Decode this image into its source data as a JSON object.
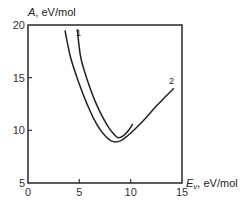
{
  "chart_data": {
    "type": "line",
    "title": "",
    "xlabel": "E_v, eV/mol",
    "xlabel_var": "E",
    "xlabel_sub": "v",
    "xlabel_unit": ", eV/mol",
    "ylabel": "A, eV/mol",
    "ylabel_var": "A",
    "ylabel_unit": ", eV/mol",
    "xlim": [
      0,
      15
    ],
    "ylim": [
      5,
      20
    ],
    "xticks": [
      0,
      5,
      10,
      15
    ],
    "yticks": [
      5,
      10,
      15,
      20
    ],
    "grid": false,
    "legend": "inline curve labels",
    "series": [
      {
        "name": "1",
        "x": [
          4.8,
          5.1,
          5.6,
          6.2,
          6.7,
          7.3,
          7.9,
          8.4,
          8.8,
          9.3,
          9.8,
          10.2
        ],
        "y": [
          19.6,
          17.1,
          15.3,
          13.6,
          12.4,
          11.2,
          10.2,
          9.6,
          9.3,
          9.5,
          10.0,
          10.6
        ]
      },
      {
        "name": "2",
        "x": [
          3.6,
          4.1,
          4.7,
          5.3,
          5.8,
          6.4,
          7.0,
          7.6,
          8.1,
          8.5,
          9.0,
          9.6,
          10.5,
          11.5,
          12.5,
          13.4,
          14.2
        ],
        "y": [
          19.5,
          17.1,
          15.2,
          13.6,
          12.4,
          11.1,
          10.1,
          9.4,
          9.0,
          8.9,
          9.0,
          9.4,
          10.2,
          11.2,
          12.3,
          13.2,
          14.0
        ]
      }
    ]
  },
  "labels": {
    "curve1": "1",
    "curve2": "2"
  }
}
